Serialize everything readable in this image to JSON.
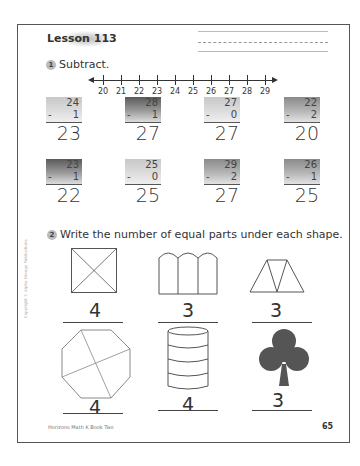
{
  "header": {
    "lesson_title": "Lesson 113"
  },
  "section1": {
    "number": "1",
    "instruction": "Subtract.",
    "number_line": {
      "labels": [
        "20",
        "21",
        "22",
        "23",
        "24",
        "25",
        "26",
        "27",
        "28",
        "29"
      ]
    },
    "problems": [
      {
        "top": "24",
        "minus": "-",
        "subtract": "1",
        "answer": "23",
        "shade": "light"
      },
      {
        "top": "28",
        "minus": "-",
        "subtract": "1",
        "answer": "27",
        "shade": "dark"
      },
      {
        "top": "27",
        "minus": "-",
        "subtract": "0",
        "answer": "27",
        "shade": "light"
      },
      {
        "top": "22",
        "minus": "-",
        "subtract": "2",
        "answer": "20",
        "shade": "mid"
      },
      {
        "top": "23",
        "minus": "-",
        "subtract": "1",
        "answer": "22",
        "shade": "dark"
      },
      {
        "top": "25",
        "minus": "-",
        "subtract": "0",
        "answer": "25",
        "shade": "light"
      },
      {
        "top": "29",
        "minus": "-",
        "subtract": "2",
        "answer": "27",
        "shade": "mid"
      },
      {
        "top": "26",
        "minus": "-",
        "subtract": "1",
        "answer": "25",
        "shade": "mid"
      }
    ]
  },
  "section2": {
    "number": "2",
    "instruction": "Write the number of equal parts under each shape.",
    "shapes": [
      {
        "shape": "square-x-divided",
        "answer": "4"
      },
      {
        "shape": "three-arched-panels",
        "answer": "3"
      },
      {
        "shape": "trapezoid-triangles",
        "answer": "3"
      },
      {
        "shape": "octagon-quartered",
        "answer": "4"
      },
      {
        "shape": "cylinder-stacked",
        "answer": "4"
      },
      {
        "shape": "club",
        "answer": "3"
      }
    ]
  },
  "footer": {
    "publisher": "Horizons Math K Book Two",
    "page_number": "65",
    "side_copyright": "Copyright © Alpha Omega Publications"
  }
}
